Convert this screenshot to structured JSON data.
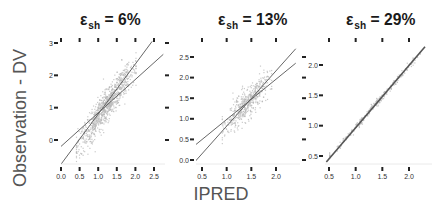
{
  "figure": {
    "ylabel": "Observation - DV",
    "xlabel": "IPRED",
    "point_color": "#b8b8b8",
    "line_color": "#555555"
  },
  "panels": [
    {
      "title_symbol": "ε",
      "title_sub": "sh",
      "title_value": "= 6%"
    },
    {
      "title_symbol": "ε",
      "title_sub": "sh",
      "title_value": "= 13%"
    },
    {
      "title_symbol": "ε",
      "title_sub": "sh",
      "title_value": "= 29%"
    }
  ],
  "chart_data": [
    {
      "type": "scatter",
      "title": "ε_sh = 6%",
      "xlabel": "IPRED",
      "ylabel": "Observation - DV",
      "x_ticks": [
        0.0,
        0.5,
        1.0,
        1.5,
        2.0,
        2.5
      ],
      "y_ticks": [
        0,
        1,
        2,
        3
      ],
      "xlim": [
        -0.05,
        2.75
      ],
      "ylim": [
        -0.75,
        3.1
      ],
      "point_cloud": {
        "x_range": [
          0.4,
          2.0
        ],
        "slope": 1.6,
        "intercept": -0.85,
        "spread": 0.25,
        "n": 900
      },
      "lines": [
        {
          "name": "regression",
          "x": [
            -0.05,
            2.75
          ],
          "y": [
            -0.25,
            2.65
          ]
        },
        {
          "name": "identity-steep",
          "x": [
            0.0,
            2.45
          ],
          "y": [
            -0.75,
            3.05
          ]
        }
      ],
      "grid": false
    },
    {
      "type": "scatter",
      "title": "ε_sh = 13%",
      "xlabel": "IPRED",
      "ylabel": "Observation - DV",
      "x_ticks": [
        0.5,
        1.0,
        1.5,
        2.0
      ],
      "y_ticks": [
        0.0,
        0.5,
        1.0,
        1.5,
        2.0,
        2.5
      ],
      "xlim": [
        0.35,
        2.4
      ],
      "ylim": [
        -0.1,
        2.85
      ],
      "point_cloud": {
        "x_range": [
          0.9,
          1.9
        ],
        "slope": 1.2,
        "intercept": -0.3,
        "spread": 0.18,
        "n": 500
      },
      "lines": [
        {
          "name": "regression",
          "x": [
            0.35,
            2.4
          ],
          "y": [
            0.35,
            2.35
          ]
        },
        {
          "name": "identity-steep",
          "x": [
            0.35,
            2.4
          ],
          "y": [
            -0.05,
            2.7
          ]
        }
      ],
      "grid": false
    },
    {
      "type": "scatter",
      "title": "ε_sh = 29%",
      "xlabel": "IPRED",
      "ylabel": "Observation - DV",
      "x_ticks": [
        0.5,
        1.0,
        1.5,
        2.0
      ],
      "y_ticks": [
        0.5,
        1.0,
        1.5,
        2.0
      ],
      "xlim": [
        0.4,
        2.35
      ],
      "ylim": [
        0.35,
        2.35
      ],
      "point_cloud": {
        "x_range": [
          0.5,
          2.2
        ],
        "slope": 1.0,
        "intercept": 0.0,
        "spread": 0.03,
        "n": 300
      },
      "lines": [
        {
          "name": "identity",
          "x": [
            0.45,
            2.3
          ],
          "y": [
            0.4,
            2.3
          ]
        }
      ],
      "grid": false
    }
  ],
  "layout": [
    {
      "plot": {
        "x0": 61,
        "x1": 165,
        "y0": 43,
        "y1": 163
      },
      "xmap": [
        [
          0.0,
          61
        ],
        [
          2.5,
          154
        ]
      ],
      "ymap": [
        [
          0,
          140
        ],
        [
          3,
          43
        ]
      ],
      "title_x": 80,
      "yaxis_x": 54,
      "xaxis_y": 167,
      "top_ticks_y": 40,
      "right_ticks_x": 165
    },
    {
      "plot": {
        "x0": 196,
        "x1": 300,
        "y0": 43,
        "y1": 163
      },
      "xmap": [
        [
          0.5,
          202
        ],
        [
          2.0,
          276
        ]
      ],
      "ymap": [
        [
          0.0,
          160
        ],
        [
          2.5,
          57
        ]
      ],
      "title_x": 218,
      "yaxis_x": 190,
      "xaxis_y": 167,
      "top_ticks_y": 40,
      "right_ticks_x": 302
    },
    {
      "plot": {
        "x0": 325,
        "x1": 432,
        "y0": 43,
        "y1": 163
      },
      "xmap": [
        [
          0.5,
          329
        ],
        [
          2.0,
          409
        ]
      ],
      "ymap": [
        [
          0.5,
          156
        ],
        [
          2.0,
          65
        ]
      ],
      "title_x": 346,
      "yaxis_x": 319,
      "xaxis_y": 167,
      "top_ticks_y": 40,
      "right_ticks_x": null
    }
  ]
}
